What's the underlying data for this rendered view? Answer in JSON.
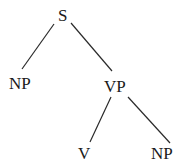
{
  "diagram": {
    "type": "syntax-tree",
    "nodes": {
      "s": "S",
      "np_subject": "NP",
      "vp": "VP",
      "v": "V",
      "np_object": "NP"
    },
    "edges": [
      [
        "S",
        "NP"
      ],
      [
        "S",
        "VP"
      ],
      [
        "VP",
        "V"
      ],
      [
        "VP",
        "NP"
      ]
    ],
    "line_color": "#2a2a2a",
    "text_color": "#1a1a1a"
  }
}
